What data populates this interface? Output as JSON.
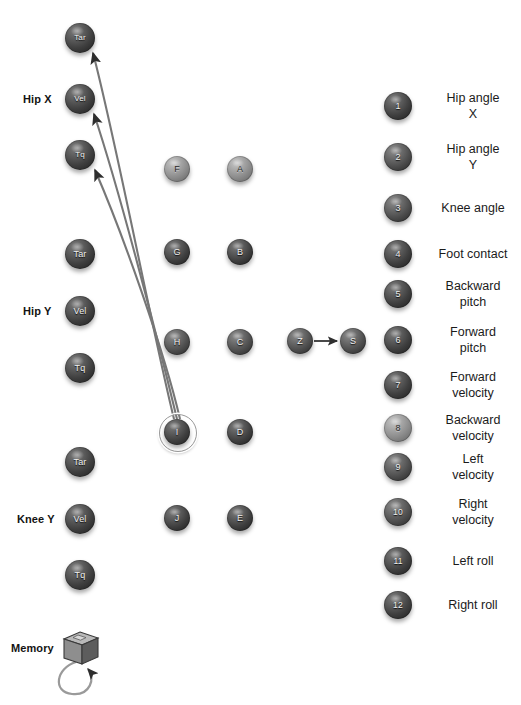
{
  "canvas": {
    "width": 521,
    "height": 705,
    "background": "#ffffff"
  },
  "palette": {
    "node_dark": "#3f3f3f",
    "node_mid": "#4c4c4c",
    "node_light": "#8b8b8b",
    "edge": "#6e6e6e",
    "text": "#1b1b1b",
    "label": "#131313"
  },
  "groups": [
    {
      "name": "group-hip-x",
      "label": "Hip X"
    },
    {
      "name": "group-hip-y",
      "label": "Hip Y"
    },
    {
      "name": "group-knee-y",
      "label": "Knee Y"
    },
    {
      "name": "group-memory",
      "label": "Memory"
    }
  ],
  "actuator_nodes": [
    {
      "id": "hipx-tar",
      "label": "Tar",
      "group": "Hip X",
      "x": 80,
      "y": 38,
      "r": 15,
      "shade": "dark"
    },
    {
      "id": "hipx-vel",
      "label": "Vel",
      "group": "Hip X",
      "x": 80,
      "y": 99,
      "r": 15,
      "shade": "dark"
    },
    {
      "id": "hipx-tq",
      "label": "Tq",
      "group": "Hip X",
      "x": 80,
      "y": 155,
      "r": 15,
      "shade": "dark"
    },
    {
      "id": "hipy-tar",
      "label": "Tar",
      "group": "Hip Y",
      "x": 80,
      "y": 254,
      "r": 15,
      "shade": "dark"
    },
    {
      "id": "hipy-vel",
      "label": "Vel",
      "group": "Hip Y",
      "x": 80,
      "y": 311,
      "r": 15,
      "shade": "dark"
    },
    {
      "id": "hipy-tq",
      "label": "Tq",
      "group": "Hip Y",
      "x": 80,
      "y": 368,
      "r": 15,
      "shade": "dark"
    },
    {
      "id": "kneey-tar",
      "label": "Tar",
      "group": "Knee Y",
      "x": 80,
      "y": 462,
      "r": 15,
      "shade": "dark"
    },
    {
      "id": "kneey-vel",
      "label": "Vel",
      "group": "Knee Y",
      "x": 80,
      "y": 519,
      "r": 15,
      "shade": "dark"
    },
    {
      "id": "kneey-tq",
      "label": "Tq",
      "group": "Knee Y",
      "x": 80,
      "y": 575,
      "r": 15,
      "shade": "dark"
    }
  ],
  "hidden_nodes": [
    {
      "id": "F",
      "label": "F",
      "x": 177,
      "y": 169,
      "r": 13,
      "shade": "light"
    },
    {
      "id": "G",
      "label": "G",
      "x": 177,
      "y": 252,
      "r": 13,
      "shade": "dark"
    },
    {
      "id": "H",
      "label": "H",
      "x": 177,
      "y": 342,
      "r": 13,
      "shade": "mid"
    },
    {
      "id": "I",
      "label": "I",
      "x": 177,
      "y": 432,
      "r": 13,
      "shade": "dark",
      "selected": true
    },
    {
      "id": "J",
      "label": "J",
      "x": 177,
      "y": 518,
      "r": 13,
      "shade": "dark"
    },
    {
      "id": "A",
      "label": "A",
      "x": 240,
      "y": 169,
      "r": 13,
      "shade": "light"
    },
    {
      "id": "B",
      "label": "B",
      "x": 240,
      "y": 252,
      "r": 13,
      "shade": "dark"
    },
    {
      "id": "C",
      "label": "C",
      "x": 240,
      "y": 342,
      "r": 13,
      "shade": "mid"
    },
    {
      "id": "D",
      "label": "D",
      "x": 240,
      "y": 432,
      "r": 13,
      "shade": "dark"
    },
    {
      "id": "E",
      "label": "E",
      "x": 240,
      "y": 518,
      "r": 13,
      "shade": "dark"
    }
  ],
  "signal_nodes": [
    {
      "id": "Z",
      "label": "Z",
      "x": 300,
      "y": 341,
      "r": 13,
      "shade": "mid"
    },
    {
      "id": "S",
      "label": "S",
      "x": 353,
      "y": 341,
      "r": 13,
      "shade": "mid"
    }
  ],
  "sensor_nodes": [
    {
      "id": "sensor-1",
      "label": "1",
      "x": 398,
      "y": 106,
      "r": 14,
      "shade": "dark",
      "legend": "Hip angle\nX"
    },
    {
      "id": "sensor-2",
      "label": "2",
      "x": 398,
      "y": 157,
      "r": 14,
      "shade": "mid",
      "legend": "Hip angle\nY"
    },
    {
      "id": "sensor-3",
      "label": "3",
      "x": 398,
      "y": 208,
      "r": 14,
      "shade": "mid",
      "legend": "Knee angle"
    },
    {
      "id": "sensor-4",
      "label": "4",
      "x": 398,
      "y": 254,
      "r": 14,
      "shade": "dark",
      "legend": "Foot contact"
    },
    {
      "id": "sensor-5",
      "label": "5",
      "x": 398,
      "y": 294,
      "r": 14,
      "shade": "dark",
      "legend": "Backward\npitch"
    },
    {
      "id": "sensor-6",
      "label": "6",
      "x": 398,
      "y": 340,
      "r": 14,
      "shade": "dark",
      "legend": "Forward\npitch"
    },
    {
      "id": "sensor-7",
      "label": "7",
      "x": 398,
      "y": 385,
      "r": 14,
      "shade": "dark",
      "legend": "Forward\nvelocity"
    },
    {
      "id": "sensor-8",
      "label": "8",
      "x": 398,
      "y": 428,
      "r": 14,
      "shade": "light",
      "legend": "Backward\nvelocity"
    },
    {
      "id": "sensor-9",
      "label": "9",
      "x": 398,
      "y": 467,
      "r": 14,
      "shade": "mid",
      "legend": "Left\nvelocity"
    },
    {
      "id": "sensor-10",
      "label": "10",
      "x": 398,
      "y": 512,
      "r": 14,
      "shade": "mid",
      "legend": "Right\nvelocity"
    },
    {
      "id": "sensor-11",
      "label": "11",
      "x": 398,
      "y": 561,
      "r": 14,
      "shade": "dark",
      "legend": "Left roll"
    },
    {
      "id": "sensor-12",
      "label": "12",
      "x": 398,
      "y": 605,
      "r": 14,
      "shade": "dark",
      "legend": "Right roll"
    }
  ],
  "memory": {
    "label": "Memory",
    "cube_x": 80,
    "cube_y": 648,
    "self_loop": true
  },
  "edges": [
    {
      "id": "edge-i-to-hipx-tar",
      "from": "I",
      "to": "hipx-tar",
      "arrow": true
    },
    {
      "id": "edge-i-to-hipx-vel",
      "from": "I",
      "to": "hipx-vel",
      "arrow": true
    },
    {
      "id": "edge-i-to-hipx-tq",
      "from": "I",
      "to": "hipx-tq",
      "arrow": true
    },
    {
      "id": "edge-z-to-s",
      "from": "Z",
      "to": "S",
      "arrow": true
    },
    {
      "id": "edge-memory-self",
      "from": "memory",
      "to": "memory",
      "arrow": true
    }
  ]
}
